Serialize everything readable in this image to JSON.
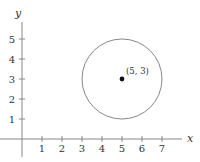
{
  "chart_data": {
    "type": "scatter",
    "title": "",
    "xlabel": "x",
    "ylabel": "y",
    "xlim": [
      -0.3,
      8
    ],
    "ylim": [
      -1,
      6
    ],
    "grid": false,
    "x_ticks": [
      1,
      2,
      3,
      4,
      5,
      6,
      7
    ],
    "y_ticks": [
      1,
      2,
      3,
      4,
      5
    ],
    "points": [
      {
        "x": 5,
        "y": 3,
        "label": "(5, 3)"
      }
    ],
    "shapes": [
      {
        "type": "circle",
        "center": [
          5,
          3
        ],
        "radius": 2
      }
    ]
  },
  "style": {
    "axis_color": "#888888",
    "circle_color": "#888888",
    "point_color": "#111111",
    "text_color": "#333333"
  }
}
